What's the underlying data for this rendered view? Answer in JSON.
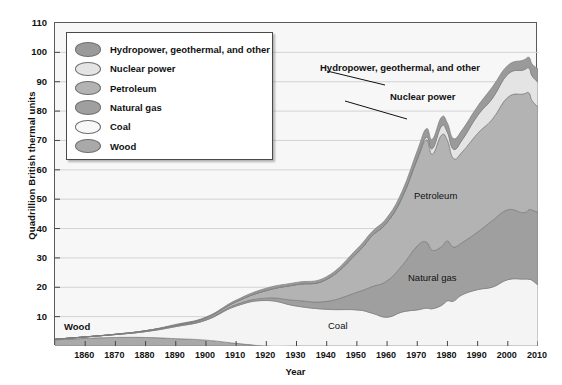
{
  "chart_data": {
    "type": "area",
    "stacked": true,
    "title": "",
    "subtitle": "",
    "xlabel": "Year",
    "ylabel": "Quadrillion British thermal units",
    "xlim": [
      1850,
      2010
    ],
    "ylim": [
      0,
      110
    ],
    "ytick_values": [
      10,
      20,
      30,
      40,
      50,
      60,
      70,
      80,
      90,
      100,
      110
    ],
    "xtick_values": [
      1860,
      1870,
      1880,
      1890,
      1900,
      1910,
      1920,
      1930,
      1940,
      1950,
      1960,
      1970,
      1980,
      1990,
      2000,
      2010
    ],
    "grid": "horizontal",
    "legend_position": "upper-left-inside",
    "stack_order_bottom_to_top": [
      "Wood",
      "Coal",
      "Natural gas",
      "Petroleum",
      "Nuclear power",
      "Hydropower, geothermal, and other"
    ],
    "x": [
      1850,
      1860,
      1870,
      1880,
      1890,
      1900,
      1910,
      1920,
      1930,
      1940,
      1950,
      1955,
      1960,
      1965,
      1970,
      1973,
      1975,
      1978,
      1980,
      1982,
      1985,
      1990,
      1995,
      2000,
      2005,
      2007,
      2008,
      2010
    ],
    "series": [
      {
        "name": "Wood",
        "color": "#a9a9a9",
        "values": [
          2.1,
          2.6,
          2.9,
          2.9,
          2.5,
          2.0,
          0.9,
          0.0,
          0.0,
          0.0,
          0.0,
          0.0,
          0.0,
          0.0,
          0.0,
          0.0,
          0.0,
          0.0,
          0.0,
          0.0,
          0.0,
          0.0,
          0.0,
          0.0,
          0.0,
          0.0,
          0.0,
          0.0
        ]
      },
      {
        "name": "Coal",
        "color": "#f4f4f4",
        "values": [
          0.2,
          0.5,
          1.0,
          2.0,
          4.1,
          6.8,
          12.7,
          15.5,
          13.6,
          12.5,
          12.3,
          11.2,
          9.8,
          11.6,
          12.3,
          12.9,
          12.7,
          13.8,
          15.4,
          15.3,
          17.5,
          19.2,
          20.1,
          22.6,
          22.8,
          22.7,
          22.4,
          20.8
        ]
      },
      {
        "name": "Natural gas",
        "color": "#9f9f9f",
        "values": [
          0.0,
          0.0,
          0.0,
          0.1,
          0.3,
          0.3,
          0.5,
          0.8,
          1.9,
          2.7,
          6.0,
          9.0,
          12.4,
          15.8,
          21.8,
          22.5,
          19.9,
          20.0,
          20.4,
          18.4,
          17.8,
          19.6,
          22.7,
          23.8,
          22.6,
          23.7,
          23.9,
          24.7
        ]
      },
      {
        "name": "Petroleum",
        "color": "#b3b3b3",
        "values": [
          0.0,
          0.0,
          0.1,
          0.2,
          0.2,
          0.5,
          1.0,
          2.6,
          5.4,
          7.5,
          13.3,
          17.3,
          19.9,
          23.2,
          29.5,
          34.8,
          32.7,
          38.0,
          34.2,
          30.2,
          30.9,
          33.6,
          34.6,
          38.3,
          40.4,
          39.8,
          37.3,
          35.9
        ]
      },
      {
        "name": "Nuclear power",
        "color": "#e4e4e4",
        "values": [
          0.0,
          0.0,
          0.0,
          0.0,
          0.0,
          0.0,
          0.0,
          0.0,
          0.0,
          0.0,
          0.0,
          0.0,
          0.0,
          0.04,
          0.24,
          0.91,
          1.9,
          3.02,
          2.74,
          3.13,
          4.15,
          6.1,
          7.08,
          7.86,
          8.16,
          8.46,
          8.43,
          8.43
        ]
      },
      {
        "name": "Hydropower, geothermal, and other",
        "color": "#9a9a9a",
        "values": [
          0.0,
          0.0,
          0.0,
          0.0,
          0.25,
          0.25,
          0.54,
          0.79,
          0.75,
          0.92,
          1.45,
          1.41,
          1.66,
          2.06,
          2.65,
          2.9,
          3.18,
          3.07,
          3.14,
          3.62,
          3.43,
          3.15,
          3.9,
          3.0,
          3.35,
          3.65,
          4.04,
          4.55
        ]
      }
    ],
    "peak_total_approx": 101,
    "peak_year_approx": 2007,
    "annotations": [
      {
        "text": "Hydropower, geothermal, and other",
        "bold": true,
        "leader": true,
        "target_year": 1998
      },
      {
        "text": "Nuclear power",
        "bold": true,
        "leader": true,
        "target_year": 1998
      },
      {
        "text": "Petroleum",
        "bold": false,
        "leader": false,
        "target_year": 1982
      },
      {
        "text": "Natural gas",
        "bold": false,
        "leader": false,
        "target_year": 1980
      },
      {
        "text": "Coal",
        "bold": false,
        "leader": false,
        "target_year": 1960
      },
      {
        "text": "Wood",
        "bold": true,
        "leader": false,
        "target_year": 1855
      }
    ]
  },
  "axes": {
    "y_title": "Quadrillion British thermal units",
    "x_title": "Year",
    "y_ticks": [
      "110",
      "100",
      "90",
      "80",
      "70",
      "60",
      "50",
      "40",
      "30",
      "20",
      "10"
    ],
    "x_ticks": [
      "1860",
      "1870",
      "1880",
      "1890",
      "1900",
      "1910",
      "1920",
      "1930",
      "1940",
      "1950",
      "1960",
      "1970",
      "1980",
      "1990",
      "2000",
      "2010"
    ]
  },
  "legend": {
    "items": [
      {
        "label": "Hydropower, geothermal, and other",
        "color": "#9a9a9a"
      },
      {
        "label": "Nuclear power",
        "color": "#e4e4e4"
      },
      {
        "label": "Petroleum",
        "color": "#b3b3b3"
      },
      {
        "label": "Natural gas",
        "color": "#9f9f9f"
      },
      {
        "label": "Coal",
        "color": "#f8f8f8"
      },
      {
        "label": "Wood",
        "color": "#a9a9a9"
      }
    ]
  },
  "annotations": {
    "hydro": "Hydropower, geothermal, and other",
    "nuclear": "Nuclear power",
    "petroleum": "Petroleum",
    "natural_gas": "Natural gas",
    "coal": "Coal",
    "wood": "Wood"
  },
  "style": {
    "plot_background": "#f7f7f7",
    "gridline_color": "#d3d3d3",
    "plot_border": "#5a5a5a",
    "text_color": "#111111"
  }
}
